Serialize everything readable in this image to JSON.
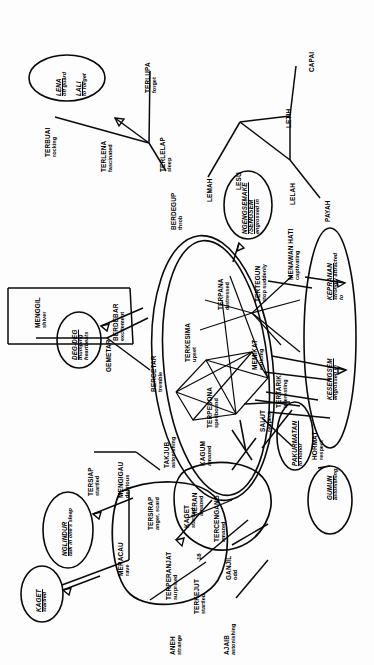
{
  "document": {
    "type": "semantic-network-diagram",
    "orientation": "rotated-90-ccw",
    "language": "Indonesian / Javanese emotion lexicon",
    "background_color": "#ffffff",
    "ink_color": "#0a0a0a"
  },
  "markers": [
    {
      "id": "m1",
      "label": "-18"
    }
  ],
  "nodes": [
    {
      "id": "n01",
      "term": "LENA",
      "gloss": "off guard",
      "style": "italic-ellipse"
    },
    {
      "id": "n02",
      "term": "LALI",
      "gloss": "to forget",
      "style": "italic-ellipse"
    },
    {
      "id": "n03",
      "term": "TERBUAI",
      "gloss": "rocking",
      "style": "plain"
    },
    {
      "id": "n04",
      "term": "TERLENA",
      "gloss": "fascinated",
      "style": "plain"
    },
    {
      "id": "n05",
      "term": "TERLUPA",
      "gloss": "forget",
      "style": "plain"
    },
    {
      "id": "n06",
      "term": "TERLELAP",
      "gloss": "sleep",
      "style": "plain"
    },
    {
      "id": "n07",
      "term": "BERDEGUP",
      "gloss": "throb",
      "style": "plain"
    },
    {
      "id": "n08",
      "term": "CAPAI",
      "gloss": "",
      "style": "plain"
    },
    {
      "id": "n09",
      "term": "LETIH",
      "gloss": "",
      "style": "plain"
    },
    {
      "id": "n10",
      "term": "LESU",
      "gloss": "",
      "style": "plain"
    },
    {
      "id": "n11",
      "term": "LELAH",
      "gloss": "",
      "style": "plain"
    },
    {
      "id": "n12",
      "term": "LEMAH",
      "gloss": "",
      "style": "plain"
    },
    {
      "id": "n13",
      "term": "PAYAH",
      "gloss": "",
      "style": "plain"
    },
    {
      "id": "n14",
      "term": "NGENGSEMAKE /SENGSEM",
      "gloss": "engrossed in",
      "style": "italic-ellipse"
    },
    {
      "id": "n15",
      "term": "BERDEBAR",
      "gloss": "excitement",
      "style": "plain"
    },
    {
      "id": "n16",
      "term": "MENGGIL",
      "gloss": "shiver",
      "style": "plain"
    },
    {
      "id": "n17",
      "term": "DEG-DEG",
      "gloss": "thumping heartbeats",
      "style": "italic-ellipse"
    },
    {
      "id": "n18",
      "term": "GEMETAR",
      "gloss": "",
      "style": "plain"
    },
    {
      "id": "n19",
      "term": "BERGETAR",
      "gloss": "tremble",
      "style": "plain"
    },
    {
      "id": "n20",
      "term": "TERKESIMA",
      "gloss": "upset",
      "style": "plain"
    },
    {
      "id": "n21",
      "term": "TERPANA",
      "gloss": "distressed",
      "style": "plain"
    },
    {
      "id": "n22",
      "term": "TERPESONA",
      "gloss": "spellbound",
      "style": "plain"
    },
    {
      "id": "n23",
      "term": "TERTEGUN",
      "gloss": "stop suddenly",
      "style": "plain"
    },
    {
      "id": "n24",
      "term": "MEMIKAT",
      "gloss": "enticing",
      "style": "plain"
    },
    {
      "id": "n25",
      "term": "TERTARIK",
      "gloss": "interesting",
      "style": "plain"
    },
    {
      "id": "n26",
      "term": "MENAWAN HATI",
      "gloss": "captivating",
      "style": "plain"
    },
    {
      "id": "n27",
      "term": "KEPRANAN",
      "gloss": "strongly attracted to",
      "style": "italic-ellipse"
    },
    {
      "id": "n28",
      "term": "KESENGSEM",
      "gloss": "engrossed in",
      "style": "italic-ellipse"
    },
    {
      "id": "n29",
      "term": "GUMUN",
      "gloss": "astonishing",
      "style": "italic-ellipse"
    },
    {
      "id": "n30",
      "term": "TAKJUB",
      "gloss": "astonishing",
      "style": "plain"
    },
    {
      "id": "n31",
      "term": "KAGUM",
      "gloss": "amazed",
      "style": "plain"
    },
    {
      "id": "n32",
      "term": "HERAN",
      "gloss": "amazed",
      "style": "plain"
    },
    {
      "id": "n33",
      "term": "TERCENGANG",
      "gloss": "amazed",
      "style": "plain"
    },
    {
      "id": "n34",
      "term": "SALUT",
      "gloss": "respect",
      "style": "plain"
    },
    {
      "id": "n35",
      "term": "HORMAT",
      "gloss": "respect",
      "style": "plain"
    },
    {
      "id": "n36",
      "term": "PAKURMATAN",
      "gloss": "to honor",
      "style": "italic-ellipse"
    },
    {
      "id": "n37",
      "term": "TERSIAP",
      "gloss": "startled",
      "style": "plain"
    },
    {
      "id": "n38",
      "term": "MENGIGAU",
      "gloss": "delirious",
      "style": "plain"
    },
    {
      "id": "n39",
      "term": "NGLINDUR",
      "gloss": "talk in one's sleep",
      "style": "italic-ellipse"
    },
    {
      "id": "n40",
      "term": "MERACAU",
      "gloss": "rave",
      "style": "plain"
    },
    {
      "id": "n41",
      "term": "KAGET",
      "gloss": "startled",
      "style": "italic-ellipse"
    },
    {
      "id": "n42",
      "term": "TERSIRAP",
      "gloss": "anger, scard",
      "style": "plain"
    },
    {
      "id": "n43",
      "term": "TERPERANJAT",
      "gloss": "surprised",
      "style": "plain"
    },
    {
      "id": "n44",
      "term": "KAGET",
      "gloss": "startled",
      "style": "plain"
    },
    {
      "id": "n45",
      "term": "TERKEJUT",
      "gloss": "startled",
      "style": "plain"
    },
    {
      "id": "n46",
      "term": "GANJIL",
      "gloss": "odd",
      "style": "plain"
    },
    {
      "id": "n47",
      "term": "ANEH",
      "gloss": "strange",
      "style": "plain"
    },
    {
      "id": "n48",
      "term": "AJAIB",
      "gloss": "astonishing",
      "style": "plain"
    }
  ]
}
